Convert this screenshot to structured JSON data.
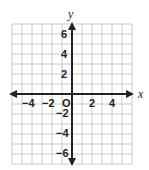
{
  "chart_data": {
    "type": "coordinate-plane",
    "title": "",
    "xlabel": "x",
    "ylabel": "y",
    "xlim": [
      -6,
      6
    ],
    "ylim": [
      -7,
      7
    ],
    "grid": true,
    "grid_step": 1,
    "x_ticks": [
      -4,
      -2,
      2,
      4
    ],
    "y_ticks": [
      6,
      4,
      2,
      -2,
      -4,
      -6
    ],
    "origin_label": "O",
    "series": []
  },
  "labels": {
    "x_axis": "x",
    "y_axis": "y",
    "origin": "O",
    "x_tick_labels": [
      "−4",
      "−2",
      "2",
      "4"
    ],
    "y_tick_labels": [
      "6",
      "4",
      "2",
      "−2",
      "−4",
      "−6"
    ]
  },
  "colors": {
    "axis": "#222222",
    "grid": "#bdbdbd"
  }
}
